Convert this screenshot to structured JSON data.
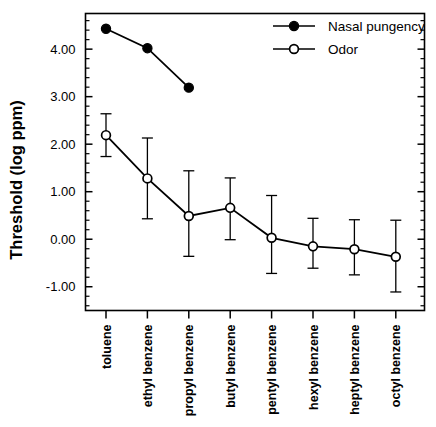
{
  "chart_data": {
    "type": "line",
    "title": "",
    "xlabel": "",
    "ylabel": "Threshold  (log  ppm)",
    "categories": [
      "toluene",
      "ethyl benzene",
      "propyl benzene",
      "butyl benzene",
      "pentyl benzene",
      "hexyl benzene",
      "heptyl benzene",
      "octyl benzene"
    ],
    "ylim": [
      -1.5,
      4.75
    ],
    "yticks": [
      4.0,
      3.0,
      2.0,
      1.0,
      0.0,
      -1.0
    ],
    "ytick_labels": [
      "4.00",
      "3.00",
      "2.00",
      "1.00",
      "0.00",
      "-1.00"
    ],
    "minor_tick_step": 0.2,
    "grid": false,
    "legend_position": "top-right",
    "series": [
      {
        "name": "Nasal pungency",
        "marker": "filled-circle",
        "color": "#000000",
        "x": [
          "toluene",
          "ethyl benzene",
          "propyl benzene"
        ],
        "values": [
          4.43,
          4.02,
          3.19
        ],
        "err_low": [
          null,
          null,
          null
        ],
        "err_high": [
          null,
          null,
          null
        ]
      },
      {
        "name": "Odor",
        "marker": "open-circle",
        "color": "#000000",
        "x": [
          "toluene",
          "ethyl benzene",
          "propyl benzene",
          "butyl benzene",
          "pentyl benzene",
          "hexyl benzene",
          "heptyl benzene",
          "octyl benzene"
        ],
        "values": [
          2.19,
          1.28,
          0.49,
          0.66,
          0.03,
          -0.15,
          -0.21,
          -0.37
        ],
        "err_low": [
          1.74,
          0.43,
          -0.36,
          -0.01,
          -0.72,
          -0.61,
          -0.75,
          -1.11
        ],
        "err_high": [
          2.64,
          2.13,
          1.44,
          1.29,
          0.92,
          0.44,
          0.41,
          0.4
        ]
      }
    ],
    "legend": [
      {
        "label": "Nasal pungency",
        "marker": "filled-circle"
      },
      {
        "label": "Odor",
        "marker": "open-circle"
      }
    ]
  },
  "colors": {
    "foreground": "#000000",
    "background": "#ffffff"
  }
}
